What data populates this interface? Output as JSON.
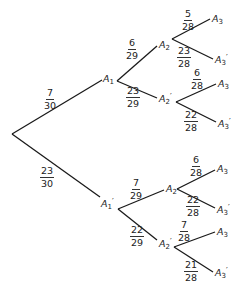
{
  "diagram": {
    "type": "probability-tree",
    "root": {
      "x": 12,
      "y": 134
    },
    "level1": [
      {
        "label": "A",
        "sub": "1",
        "prime": "",
        "prob_num": "7",
        "prob_den": "30",
        "end": {
          "x": 102,
          "y": 80
        }
      },
      {
        "label": "A",
        "sub": "1",
        "prime": "′",
        "prob_num": "23",
        "prob_den": "30",
        "end": {
          "x": 100,
          "y": 197
        }
      }
    ],
    "level2": [
      {
        "parent": "A1",
        "label": "A",
        "sub": "2",
        "prime": "",
        "prob_num": "6",
        "prob_den": "29"
      },
      {
        "parent": "A1",
        "label": "A",
        "sub": "2",
        "prime": "′",
        "prob_num": "23",
        "prob_den": "29"
      },
      {
        "parent": "A1'",
        "label": "A",
        "sub": "2",
        "prime": "",
        "prob_num": "7",
        "prob_den": "29"
      },
      {
        "parent": "A1'",
        "label": "A",
        "sub": "2",
        "prime": "′",
        "prob_num": "22",
        "prob_den": "29"
      }
    ],
    "level3": [
      {
        "parent": "A1-A2",
        "label": "A",
        "sub": "3",
        "prime": "",
        "prob_num": "5",
        "prob_den": "28"
      },
      {
        "parent": "A1-A2",
        "label": "A",
        "sub": "3",
        "prime": "′",
        "prob_num": "23",
        "prob_den": "28"
      },
      {
        "parent": "A1-A2'",
        "label": "A",
        "sub": "3",
        "prime": "",
        "prob_num": "6",
        "prob_den": "28"
      },
      {
        "parent": "A1-A2'",
        "label": "A",
        "sub": "3",
        "prime": "′",
        "prob_num": "22",
        "prob_den": "28"
      },
      {
        "parent": "A1'-A2",
        "label": "A",
        "sub": "3",
        "prime": "",
        "prob_num": "6",
        "prob_den": "28"
      },
      {
        "parent": "A1'-A2",
        "label": "A",
        "sub": "3",
        "prime": "′",
        "prob_num": "22",
        "prob_den": "28"
      },
      {
        "parent": "A1'-A2'",
        "label": "A",
        "sub": "3",
        "prime": "",
        "prob_num": "7",
        "prob_den": "28"
      },
      {
        "parent": "A1'-A2'",
        "label": "A",
        "sub": "3",
        "prime": "′",
        "prob_num": "21",
        "prob_den": "28"
      }
    ]
  }
}
